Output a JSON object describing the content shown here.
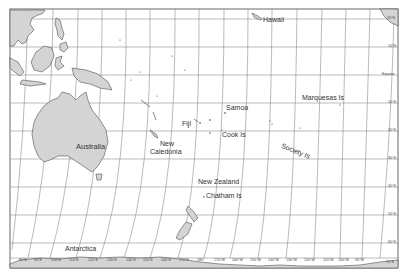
{
  "map": {
    "title": "",
    "region": "Oceania / South Pacific",
    "colors": {
      "land": "#d4d4d4",
      "coast": "#333333",
      "grid": "#666666",
      "frame": "#444444",
      "background": "#ffffff"
    },
    "labels": {
      "hawaii": "Hawaii",
      "marquesas": "Marquesas Is",
      "samoa": "Samoa",
      "fiji": "Fiji",
      "cook": "Cook Is",
      "society": "Society Is",
      "australia": "Australia",
      "new_caledonia_1": "New",
      "new_caledonia_2": "Caledonia",
      "new_zealand": "New Zealand",
      "chatham": "Chatham Is",
      "antarctica": "Antarctica"
    },
    "latitude_labels": {
      "n20": "20°N",
      "n10": "10°N",
      "eq": "Equator",
      "s10": "10°S",
      "s20": "20°S",
      "s30": "30°S",
      "s40": "40°S",
      "s50": "50°S",
      "s60": "60°S",
      "s70": "70°S"
    },
    "longitude_labels": [
      "80°E",
      "90°E",
      "100°E",
      "110°E",
      "120°E",
      "130°E",
      "140°E",
      "150°E",
      "160°E",
      "170°E",
      "180°",
      "170°W",
      "160°W",
      "150°W",
      "140°W",
      "130°W",
      "120°W",
      "110°W",
      "100°W",
      "90°W"
    ]
  }
}
